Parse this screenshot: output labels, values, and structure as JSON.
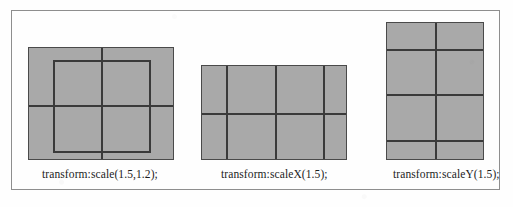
{
  "page": {
    "background": "#ffffff",
    "frame_border_color": "#8e8e8e",
    "box_fill_color": "#a9a9a9",
    "line_color": "#3a3a3a",
    "text_color": "#1c1c1c"
  },
  "figures": [
    {
      "id": "fig-1",
      "caption": "transform:scale(1.5,1.2);",
      "box": {
        "x": 28,
        "y": 47,
        "width": 146,
        "height": 113
      },
      "vertical_lines": [
        72
      ],
      "horizontal_lines": [
        57
      ],
      "origin_outline": {
        "x": 24,
        "y": 12,
        "width": 98,
        "height": 93
      },
      "transform": "scale(1.5,1.2)",
      "scale_x": 1.5,
      "scale_y": 1.2
    },
    {
      "id": "fig-2",
      "caption": "transform:scaleX(1.5);",
      "box": {
        "x": 201,
        "y": 65,
        "width": 146,
        "height": 95
      },
      "vertical_lines": [
        24,
        73,
        121
      ],
      "horizontal_lines": [
        47
      ],
      "origin_outline": null,
      "transform": "scaleX(1.5)",
      "scale_x": 1.5,
      "scale_y": 1.0
    },
    {
      "id": "fig-3",
      "caption": "transform:scaleY(1.5);",
      "box": {
        "x": 386,
        "y": 22,
        "width": 98,
        "height": 138
      },
      "vertical_lines": [
        48
      ],
      "horizontal_lines": [
        26,
        71,
        117
      ],
      "origin_outline": null,
      "transform": "scaleY(1.5)",
      "scale_x": 1.0,
      "scale_y": 1.5
    }
  ]
}
